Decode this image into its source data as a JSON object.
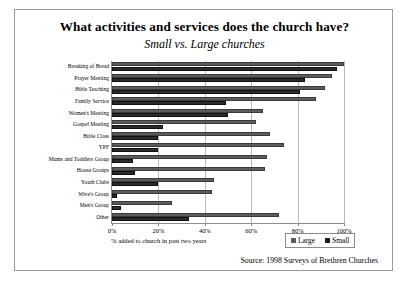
{
  "chart_data": {
    "type": "bar",
    "orientation": "horizontal",
    "title": "What activities and services does the church have?",
    "subtitle": "Small vs. Large churches",
    "xlabel": "% added to church in past two years",
    "ylabel": "",
    "xlim": [
      0,
      100
    ],
    "xticks": [
      "0%",
      "20%",
      "40%",
      "60%",
      "80%",
      "100%"
    ],
    "xtick_values": [
      0,
      20,
      40,
      60,
      80,
      100
    ],
    "grid": true,
    "legend_position": "bottom-right",
    "categories": [
      "Breaking of Bread",
      "Prayer Meeting",
      "Bible Teaching",
      "Family Service",
      "Women's Meeting",
      "Gospel Meeting",
      "Bible Class",
      "YPF",
      "Mums and Toddlers Group",
      "House Groups",
      "Youth Clubs",
      "Wive's Group",
      "Men's Group",
      "Other"
    ],
    "series": [
      {
        "name": "Large",
        "color": "#5c5c5c",
        "values": [
          100,
          95,
          92,
          88,
          65,
          62,
          68,
          74,
          67,
          66,
          44,
          43,
          26,
          72
        ]
      },
      {
        "name": "Small",
        "color": "#1c1c1c",
        "values": [
          97,
          83,
          81,
          49,
          50,
          22,
          20,
          20,
          9,
          10,
          20,
          2,
          4,
          33
        ]
      }
    ],
    "source": "Source: 1998 Surveys of Brethren Churches"
  },
  "legend": {
    "items": [
      {
        "label": "Large",
        "color": "#5c5c5c"
      },
      {
        "label": "Small",
        "color": "#1c1c1c"
      }
    ]
  }
}
